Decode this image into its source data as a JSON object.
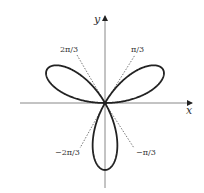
{
  "diagram": {
    "axes": {
      "x_label": "x",
      "y_label": "y"
    },
    "angle_labels": [
      {
        "id": "pi-3",
        "text": "π/3"
      },
      {
        "id": "2pi-3",
        "text": "2π/3"
      },
      {
        "id": "neg-2pi-3",
        "text": "−2π/3"
      },
      {
        "id": "neg-pi-3",
        "text": "−π/3"
      }
    ],
    "curve": {
      "type": "rose",
      "petals": 3,
      "petal_directions_deg": [
        30,
        150,
        270
      ],
      "stroke_color": "#222222"
    },
    "guide_line_color": "#555555",
    "axis_color": "#777777"
  }
}
